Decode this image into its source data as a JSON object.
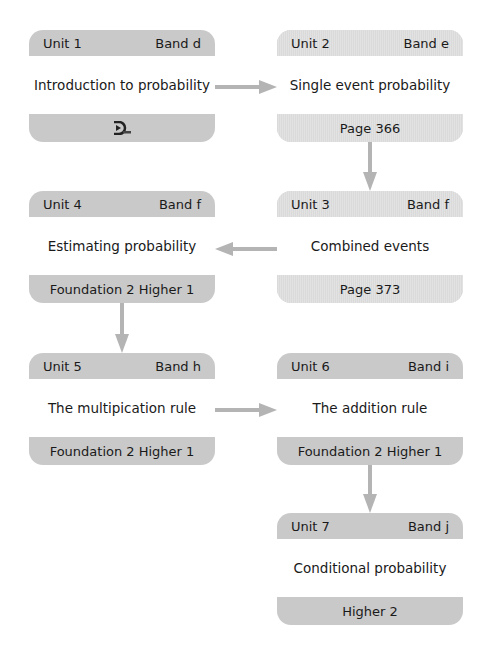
{
  "units": [
    {
      "unit": "Unit 1",
      "band": "Band d",
      "title": "Introduction to probability",
      "footer": "",
      "footer_icon": "dl-logo-icon"
    },
    {
      "unit": "Unit 2",
      "band": "Band e",
      "title": "Single event probability",
      "footer": "Page 366"
    },
    {
      "unit": "Unit 3",
      "band": "Band f",
      "title": "Combined events",
      "footer": "Page 373"
    },
    {
      "unit": "Unit 4",
      "band": "Band f",
      "title": "Estimating probability",
      "footer": "Foundation 2 Higher 1"
    },
    {
      "unit": "Unit 5",
      "band": "Band h",
      "title": "The multipication rule",
      "footer": "Foundation 2 Higher 1"
    },
    {
      "unit": "Unit 6",
      "band": "Band i",
      "title": "The addition rule",
      "footer": "Foundation 2 Higher 1"
    },
    {
      "unit": "Unit 7",
      "band": "Band j",
      "title": "Conditional probability",
      "footer": "Higher 2"
    }
  ],
  "colors": {
    "card_dark": "#c9c9c9",
    "card_light": "#d9d9d9",
    "arrow": "#b4b4b4"
  }
}
